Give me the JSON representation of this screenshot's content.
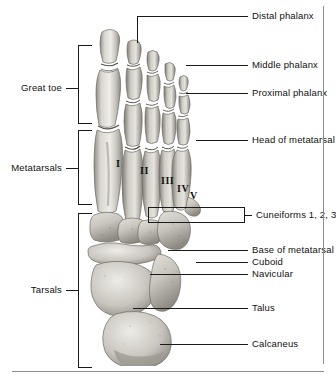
{
  "figure": {
    "view": "dorsal / superior view of right foot skeleton",
    "image_name": "foot-skeleton-radiograph"
  },
  "right_labels": [
    {
      "id": "distal-phalanx",
      "text": "Distal phalanx",
      "y": 16,
      "line_from": 137,
      "line_to": 248,
      "drop_to_y": 42
    },
    {
      "id": "middle-phalanx",
      "text": "Middle phalanx",
      "y": 65,
      "line_from": 186,
      "line_to": 248,
      "drop_to_y": null
    },
    {
      "id": "proximal-phalanx",
      "text": "Proximal phalanx",
      "y": 93,
      "line_from": 186,
      "line_to": 248,
      "drop_to_y": null
    },
    {
      "id": "head-of-metatarsal",
      "text": "Head of metatarsal",
      "y": 140,
      "line_from": 196,
      "line_to": 248,
      "drop_to_y": null
    },
    {
      "id": "cuneiforms",
      "text": "Cuneiforms 1, 2, 3",
      "y": 215,
      "line_from": 245,
      "line_to": 252,
      "drop_to_y": null
    },
    {
      "id": "base-of-metatarsal",
      "text": "Base of metatarsal",
      "y": 250,
      "line_from": 168,
      "line_to": 248,
      "drop_to_y": null
    },
    {
      "id": "cuboid",
      "text": "Cuboid",
      "y": 262,
      "line_from": 196,
      "line_to": 248,
      "drop_to_y": null
    },
    {
      "id": "navicular",
      "text": "Navicular",
      "y": 274,
      "line_from": 150,
      "line_to": 248,
      "drop_to_y": null
    },
    {
      "id": "talus",
      "text": "Talus",
      "y": 308,
      "line_from": 133,
      "line_to": 248,
      "drop_to_y": null
    },
    {
      "id": "calcaneus",
      "text": "Calcaneus",
      "y": 344,
      "line_from": 160,
      "line_to": 248,
      "drop_to_y": null
    }
  ],
  "left_labels": [
    {
      "id": "great-toe",
      "text": "Great toe",
      "y": 88,
      "bracket_top": 45,
      "bracket_bottom": 124
    },
    {
      "id": "metatarsals",
      "text": "Metatarsals",
      "y": 168,
      "bracket_top": 130,
      "bracket_bottom": 205
    },
    {
      "id": "tarsals",
      "text": "Tarsals",
      "y": 290,
      "bracket_top": 213,
      "bracket_bottom": 368
    }
  ],
  "bone_numerals": [
    {
      "text": "I",
      "x": 116,
      "y": 158
    },
    {
      "text": "II",
      "x": 140,
      "y": 165
    },
    {
      "text": "III",
      "x": 161,
      "y": 175
    },
    {
      "text": "IV",
      "x": 177,
      "y": 183
    },
    {
      "text": "V",
      "x": 190,
      "y": 190
    }
  ],
  "callout_box": {
    "id": "cuneiforms-box",
    "label": "Cuneiforms 1, 2, 3",
    "x": 148,
    "y": 207,
    "width": 97,
    "height": 16
  },
  "rules": {
    "bottom_rule": {
      "x": 12,
      "y": 371,
      "width": 312
    },
    "right_rule": {
      "x": 323,
      "y": 6,
      "height": 358
    }
  },
  "colors": {
    "ink": "#1a1a1a",
    "text": "#111111",
    "rule": "#8d8d8d",
    "bone_light": "#e9e7e2",
    "bone_mid": "#bdbab4",
    "bone_dark": "#8b8880",
    "background": "#ffffff"
  }
}
